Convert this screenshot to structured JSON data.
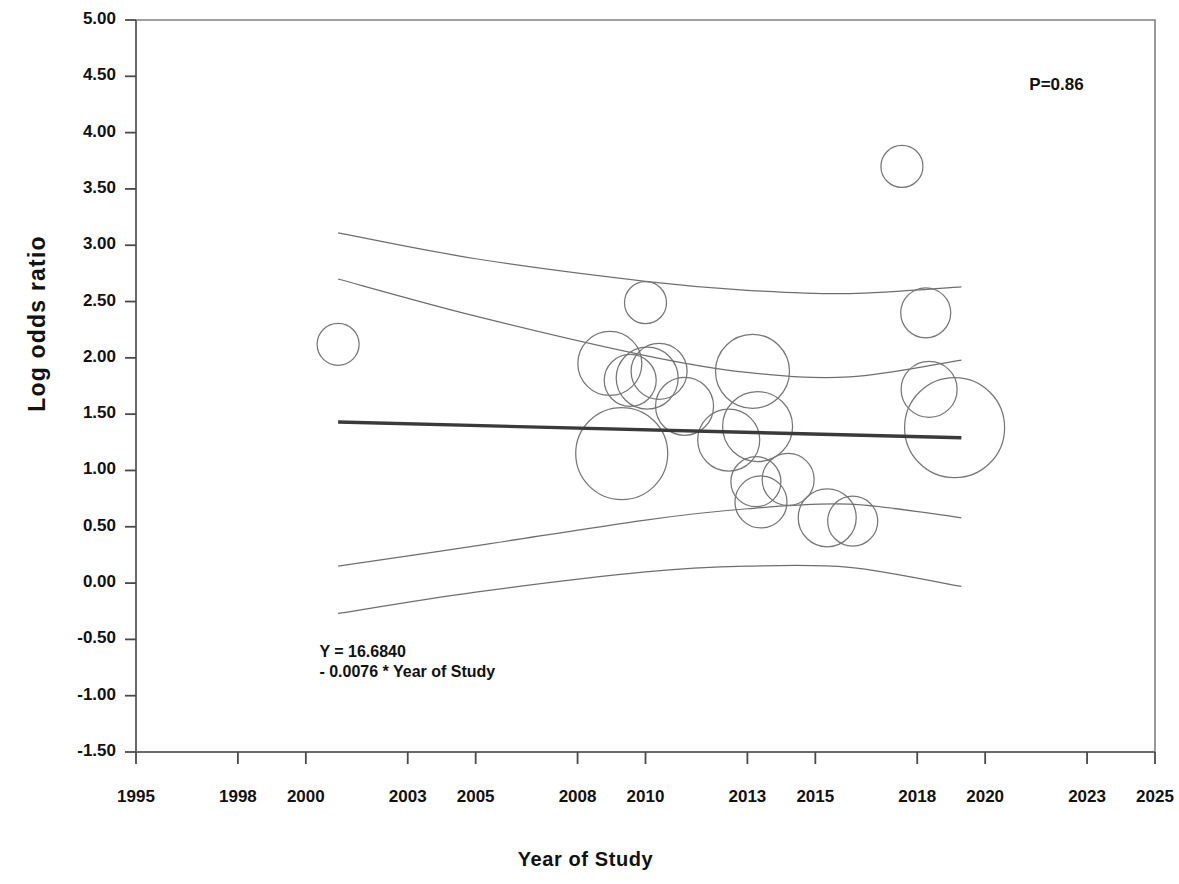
{
  "chart_data": {
    "type": "scatter",
    "title": "",
    "xlabel": "Year of Study",
    "ylabel": "Log odds ratio",
    "xlim": [
      1995,
      2025
    ],
    "ylim": [
      -1.5,
      5.0
    ],
    "grid": false,
    "legend": "none",
    "xticklabels": [
      "1995",
      "1998",
      "2000",
      "2003",
      "2005",
      "2008",
      "2010",
      "2013",
      "2015",
      "2018",
      "2020",
      "2023",
      "2025"
    ],
    "xtickvalues": [
      1995,
      1998,
      2000,
      2003,
      2005,
      2008,
      2010,
      2013,
      2015,
      2018,
      2020,
      2023,
      2025
    ],
    "yticklabels": [
      "5.00",
      "4.50",
      "4.00",
      "3.50",
      "3.00",
      "2.50",
      "2.00",
      "1.50",
      "1.00",
      "0.50",
      "0.00",
      "-0.50",
      "-1.00",
      "-1.50"
    ],
    "ytickvalues": [
      5.0,
      4.5,
      4.0,
      3.5,
      3.0,
      2.5,
      2.0,
      1.5,
      1.0,
      0.5,
      0.0,
      -0.5,
      -1.0,
      -1.5
    ],
    "annotations": [
      {
        "name": "p-value",
        "text": "P=0.86",
        "x": 2021.3,
        "y": 4.42
      },
      {
        "name": "regression-equation-line1",
        "text": "Y = 16.6840",
        "x": 2000.4,
        "y": -0.6
      },
      {
        "name": "regression-equation-line2",
        "text": "- 0.0076 * Year of Study",
        "x": 2000.4,
        "y": -0.78
      }
    ],
    "regression": {
      "name": "meta-regression-line",
      "intercept": 16.684,
      "slope": -0.0076,
      "equation": "Y = 16.6840 - 0.0076 * Year of Study",
      "p_value": 0.86,
      "x_start": 2000.95,
      "x_end": 2019.3,
      "y_start": 1.43,
      "y_end": 1.29,
      "color": "#3a3a3a"
    },
    "confidence_bands": {
      "color": "#6e6e6e",
      "outer_upper": [
        [
          2000.95,
          3.11
        ],
        [
          2005.0,
          2.88
        ],
        [
          2010.0,
          2.68
        ],
        [
          2013.0,
          2.6
        ],
        [
          2016.0,
          2.57
        ],
        [
          2019.3,
          2.63
        ]
      ],
      "inner_upper": [
        [
          2000.95,
          2.7
        ],
        [
          2005.0,
          2.37
        ],
        [
          2010.0,
          2.02
        ],
        [
          2013.0,
          1.87
        ],
        [
          2016.0,
          1.83
        ],
        [
          2019.3,
          1.98
        ]
      ],
      "inner_lower": [
        [
          2000.95,
          0.15
        ],
        [
          2005.0,
          0.33
        ],
        [
          2010.0,
          0.56
        ],
        [
          2013.0,
          0.66
        ],
        [
          2016.0,
          0.7
        ],
        [
          2019.3,
          0.58
        ]
      ],
      "outer_lower": [
        [
          2000.95,
          -0.27
        ],
        [
          2005.0,
          -0.08
        ],
        [
          2010.0,
          0.1
        ],
        [
          2013.0,
          0.15
        ],
        [
          2016.0,
          0.14
        ],
        [
          2019.3,
          -0.03
        ]
      ]
    },
    "bubbles": [
      {
        "x": 2000.95,
        "y": 2.12,
        "r_px": 21
      },
      {
        "x": 2008.95,
        "y": 1.95,
        "r_px": 32
      },
      {
        "x": 2009.55,
        "y": 1.8,
        "r_px": 26
      },
      {
        "x": 2010.0,
        "y": 2.49,
        "r_px": 21
      },
      {
        "x": 2010.05,
        "y": 1.82,
        "r_px": 31
      },
      {
        "x": 2010.4,
        "y": 1.88,
        "r_px": 28
      },
      {
        "x": 2009.3,
        "y": 1.15,
        "r_px": 46
      },
      {
        "x": 2011.15,
        "y": 1.57,
        "r_px": 29
      },
      {
        "x": 2012.45,
        "y": 1.27,
        "r_px": 31
      },
      {
        "x": 2013.15,
        "y": 1.88,
        "r_px": 37
      },
      {
        "x": 2013.3,
        "y": 1.39,
        "r_px": 35
      },
      {
        "x": 2013.25,
        "y": 0.9,
        "r_px": 25
      },
      {
        "x": 2013.4,
        "y": 0.72,
        "r_px": 26
      },
      {
        "x": 2014.2,
        "y": 0.92,
        "r_px": 26
      },
      {
        "x": 2015.35,
        "y": 0.58,
        "r_px": 29
      },
      {
        "x": 2016.1,
        "y": 0.55,
        "r_px": 25
      },
      {
        "x": 2017.55,
        "y": 3.7,
        "r_px": 21
      },
      {
        "x": 2018.25,
        "y": 2.4,
        "r_px": 25
      },
      {
        "x": 2018.35,
        "y": 1.72,
        "r_px": 28
      },
      {
        "x": 2019.1,
        "y": 1.38,
        "r_px": 50
      }
    ]
  },
  "axes": {
    "y_axis_title": "Log odds ratio",
    "x_axis_title": "Year of Study"
  }
}
